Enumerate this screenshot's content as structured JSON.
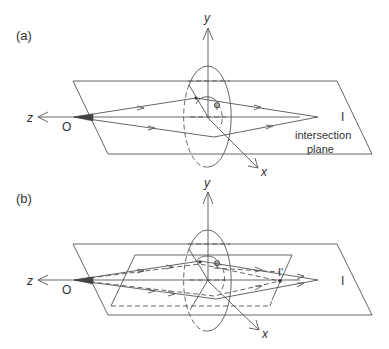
{
  "panels": [
    {
      "id": "a",
      "label": "(a)",
      "axes": {
        "y": "y",
        "z": "z",
        "x": "x"
      },
      "points": {
        "object": "O",
        "image": "I",
        "phi": "φ"
      },
      "annotation": [
        "intersection",
        "plane"
      ]
    },
    {
      "id": "b",
      "label": "(b)",
      "axes": {
        "y": "y",
        "z": "z",
        "x": "x"
      },
      "points": {
        "object": "O",
        "image": "I",
        "image_prime": "I'",
        "phi": "φ"
      }
    }
  ],
  "colors": {
    "line": "#555555",
    "text": "#333333",
    "background": "#ffffff"
  }
}
